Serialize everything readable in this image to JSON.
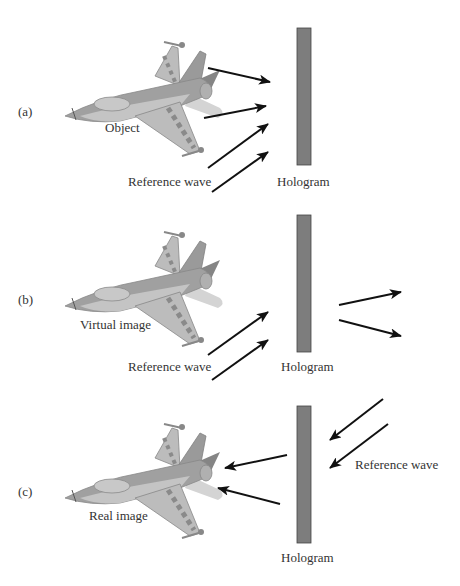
{
  "colors": {
    "hologram_fill": "#7d7d7d",
    "hologram_stroke": "#444444",
    "arrow": "#111111",
    "plane_light": "#bcbcbc",
    "plane_mid": "#9a9a9a",
    "plane_dark": "#858585",
    "plane_exhaust": "#d4d4d4",
    "text": "#333333"
  },
  "panels": [
    {
      "id": "a",
      "tag": "(a)",
      "plane_label": "Object",
      "reference_label": "Reference wave",
      "hologram_label": "Hologram"
    },
    {
      "id": "b",
      "tag": "(b)",
      "plane_label": "Virtual image",
      "reference_label": "Reference wave",
      "hologram_label": "Hologram"
    },
    {
      "id": "c",
      "tag": "(c)",
      "plane_label": "Real image",
      "reference_label": "Reference wave",
      "hologram_label": "Hologram"
    }
  ]
}
